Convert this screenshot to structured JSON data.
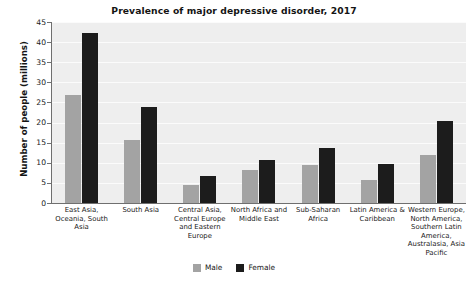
{
  "chart_data": {
    "type": "bar",
    "title": "Prevalence of major depressive disorder, 2017",
    "xlabel": "",
    "ylabel": "Number of people (millions)",
    "ylim": [
      0,
      45
    ],
    "yticks": [
      0,
      5,
      10,
      15,
      20,
      25,
      30,
      35,
      40,
      45
    ],
    "grid": true,
    "legend_position": "bottom-center",
    "categories": [
      "East Asia, Oceania, South Asia",
      "South Asia",
      "Central Asia, Central Europe and Eastern Europe",
      "North Africa and Middle East",
      "Sub-Saharan Africa",
      "Latin America & Caribbean",
      "Western Europe, North America, Southern Latin America, Australasia, Asia Pacific"
    ],
    "series": [
      {
        "name": "Male",
        "color": "#a3a3a3",
        "values": [
          26.8,
          15.7,
          4.4,
          8.1,
          9.4,
          5.6,
          11.9
        ]
      },
      {
        "name": "Female",
        "color": "#1c1c1c",
        "values": [
          42.2,
          23.8,
          6.8,
          10.8,
          13.7,
          9.6,
          20.5
        ]
      }
    ]
  },
  "legend": {
    "entries": [
      {
        "label": "Male",
        "color": "#a3a3a3"
      },
      {
        "label": "Female",
        "color": "#1c1c1c"
      }
    ]
  },
  "axis_labels": {
    "y_title": "Number of people (millions)",
    "y_ticks": [
      "0",
      "5",
      "10",
      "15",
      "20",
      "25",
      "30",
      "35",
      "40",
      "45"
    ],
    "x_ticks": [
      "East Asia, Oceania, South Asia",
      "South Asia",
      "Central Asia, Central Europe and Eastern Europe",
      "North Africa and Middle East",
      "Sub-Saharan Africa",
      "Latin America & Caribbean",
      "Western Europe, North America, Southern Latin America, Australasia, Asia Pacific"
    ]
  },
  "colors": {
    "plot_background": "#eeeeee",
    "gridline": "#fbfbfb",
    "axis": "#6f6f6f",
    "male": "#a3a3a3",
    "female": "#1c1c1c"
  }
}
